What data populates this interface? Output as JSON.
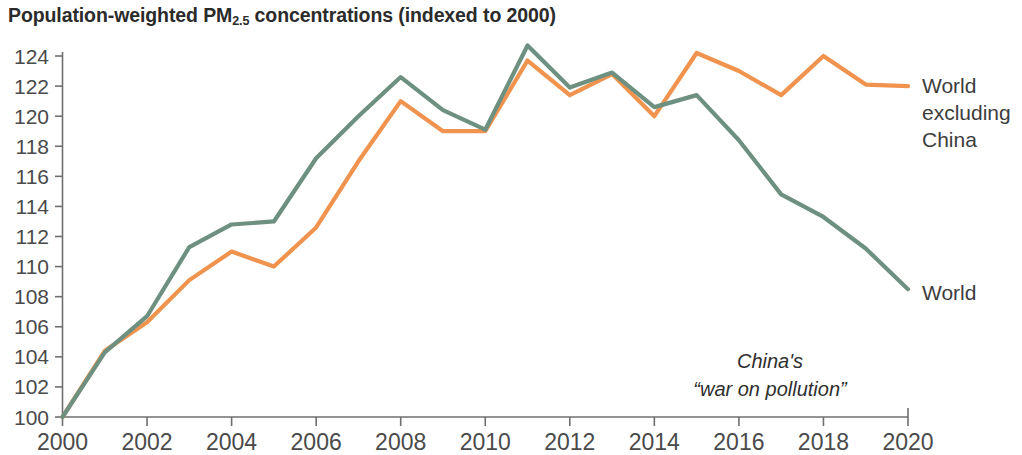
{
  "chart_data": {
    "type": "line",
    "title": "Population-weighted PM2.5 concentrations (indexed to 2000)",
    "title_main": "Population-weighted PM",
    "title_sub": "2.5",
    "title_rest": " concentrations (indexed to 2000)",
    "xlabel": "",
    "ylabel": "",
    "xlim": [
      2000,
      2020
    ],
    "ylim": [
      100,
      124
    ],
    "grid": false,
    "legend_position": "right-inline",
    "x": [
      2000,
      2001,
      2002,
      2003,
      2004,
      2005,
      2006,
      2007,
      2008,
      2009,
      2010,
      2011,
      2012,
      2013,
      2014,
      2015,
      2016,
      2017,
      2018,
      2019,
      2020
    ],
    "x_ticks": [
      "2000",
      "2002",
      "2004",
      "2006",
      "2008",
      "2010",
      "2012",
      "2014",
      "2016",
      "2018",
      "2020"
    ],
    "x_tick_values": [
      2000,
      2002,
      2004,
      2006,
      2008,
      2010,
      2012,
      2014,
      2016,
      2018,
      2020
    ],
    "y_ticks": [
      "100",
      "102",
      "104",
      "106",
      "108",
      "110",
      "112",
      "114",
      "116",
      "118",
      "120",
      "122",
      "124"
    ],
    "y_tick_values": [
      100,
      102,
      104,
      106,
      108,
      110,
      112,
      114,
      116,
      118,
      120,
      122,
      124
    ],
    "series": [
      {
        "name": "World excluding China",
        "label": "World\nexcluding\nChina",
        "color": "#F0934E",
        "values": [
          100.0,
          104.4,
          106.3,
          109.1,
          111.0,
          110.0,
          112.6,
          117.0,
          121.0,
          119.0,
          119.0,
          123.7,
          121.4,
          122.8,
          120.0,
          124.2,
          123.0,
          121.4,
          124.0,
          122.1,
          122.0
        ]
      },
      {
        "name": "World",
        "label": "World",
        "color": "#6E9080",
        "values": [
          100.0,
          104.3,
          106.7,
          111.3,
          112.8,
          113.0,
          117.2,
          120.0,
          122.6,
          120.4,
          119.1,
          124.7,
          121.9,
          122.9,
          120.6,
          121.4,
          118.4,
          114.8,
          113.3,
          111.2,
          108.5
        ]
      }
    ],
    "annotations": [
      {
        "name": "china-war-on-pollution",
        "line1": "China's",
        "line2": "“war on pollution”",
        "x": 770,
        "y": 368
      }
    ]
  }
}
